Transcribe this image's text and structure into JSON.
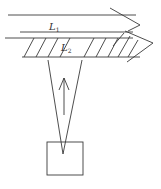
{
  "diagram": {
    "labels": {
      "beam1": "L",
      "beam1_sub": "1",
      "beam2": "L",
      "beam2_sub": "2"
    },
    "elements": [
      "arrow-beam-L1",
      "hatched-arrow-beam-L2",
      "cone-of-light",
      "upward-arrow",
      "source-box"
    ],
    "colors": {
      "stroke": "#3a3a3a",
      "background": "#ffffff"
    }
  }
}
